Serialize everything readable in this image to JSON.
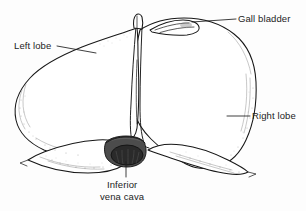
{
  "figure": {
    "view": "anterior view",
    "background_color": "#fdfdfd",
    "ink_color": "#171717",
    "vessel_color": "#4c4c4c"
  },
  "labels": {
    "gall_bladder": "Gall bladder",
    "left_lobe": "Left lobe",
    "right_lobe": "Right lobe",
    "inferior_vena_cava_line1": "Inferior",
    "inferior_vena_cava_line2": "vena cava"
  },
  "parts": [
    {
      "id": "gall-bladder",
      "label": "Gall bladder",
      "leader_from": [
        192,
        22
      ],
      "leader_to": [
        236,
        19
      ]
    },
    {
      "id": "left-lobe",
      "label": "Left lobe",
      "leader_from": [
        93,
        52
      ],
      "leader_to": [
        58,
        46
      ]
    },
    {
      "id": "right-lobe",
      "label": "Right lobe",
      "leader_from": [
        228,
        116
      ],
      "leader_to": [
        249,
        116
      ]
    },
    {
      "id": "inferior-vena-cava",
      "label": "Inferior vena cava",
      "leader_from": [
        126,
        160
      ],
      "leader_to": [
        126,
        176
      ]
    }
  ]
}
